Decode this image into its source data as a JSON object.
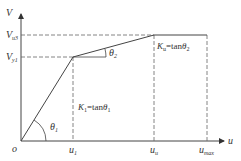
{
  "diagram": {
    "axes": {
      "y_label": "V",
      "x_label": "u",
      "origin_label": "o"
    },
    "y_ticks": [
      {
        "main": "V",
        "sub": "u3"
      },
      {
        "main": "V",
        "sub": "y1"
      }
    ],
    "x_ticks": [
      {
        "main": "u",
        "sub": "1"
      },
      {
        "main": "u",
        "sub": "u"
      },
      {
        "main": "u",
        "sub": "max"
      }
    ],
    "angles": [
      {
        "main": "θ",
        "sub": "1"
      },
      {
        "main": "θ",
        "sub": "2"
      }
    ],
    "annotations": [
      {
        "k_main": "K",
        "k_sub": "1",
        "eq": "=tan",
        "theta": "θ",
        "theta_sub": "1"
      },
      {
        "k_main": "K",
        "k_sub": "u",
        "eq": "=tan",
        "theta": "θ",
        "theta_sub": "2"
      }
    ],
    "colors": {
      "line": "#444444",
      "dash": "#666666"
    }
  }
}
